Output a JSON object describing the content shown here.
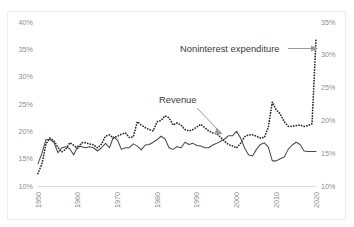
{
  "chart_data": {
    "type": "line",
    "title": "",
    "xlabel": "",
    "ylabel": "",
    "grid": false,
    "legend_position": "inline-annotations",
    "x": [
      1950,
      1951,
      1952,
      1953,
      1954,
      1955,
      1956,
      1957,
      1958,
      1959,
      1960,
      1961,
      1962,
      1963,
      1964,
      1965,
      1966,
      1967,
      1968,
      1969,
      1970,
      1971,
      1972,
      1973,
      1974,
      1975,
      1976,
      1977,
      1978,
      1979,
      1980,
      1981,
      1982,
      1983,
      1984,
      1985,
      1986,
      1987,
      1988,
      1989,
      1990,
      1991,
      1992,
      1993,
      1994,
      1995,
      1996,
      1997,
      1998,
      1999,
      2000,
      2001,
      2002,
      2003,
      2004,
      2005,
      2006,
      2007,
      2008,
      2009,
      2010,
      2011,
      2012,
      2013,
      2014,
      2015,
      2016,
      2017,
      2018,
      2019,
      2020
    ],
    "xtick_labels": [
      "1950",
      "1960",
      "1970",
      "1980",
      "1990",
      "2000",
      "2010",
      "2020"
    ],
    "xticks": [
      1950,
      1960,
      1970,
      1980,
      1990,
      2000,
      2010,
      2020
    ],
    "left_axis": {
      "label": "",
      "ticks": [
        10,
        15,
        20,
        25,
        30,
        35,
        40
      ],
      "tick_labels": [
        "10%",
        "15%",
        "20%",
        "25%",
        "30%",
        "35%",
        "40%"
      ],
      "ylim": [
        10,
        40
      ]
    },
    "right_axis": {
      "label": "",
      "ticks": [
        10,
        15,
        20,
        25,
        30,
        35
      ],
      "tick_labels": [
        "10%",
        "15%",
        "20%",
        "25%",
        "30%",
        "35%"
      ],
      "ylim": [
        10,
        35
      ]
    },
    "series": [
      {
        "name": "Noninterest expenditure",
        "style": "dotted",
        "axis": "right",
        "color": "#2a2a2a",
        "values": [
          11.9,
          13.4,
          16.4,
          17.3,
          16.9,
          15.9,
          15.2,
          15.6,
          16.6,
          16.2,
          15.7,
          16.6,
          16.6,
          16.4,
          16.3,
          15.8,
          16.4,
          17.6,
          17.8,
          17.3,
          17.6,
          17.9,
          18.1,
          17.4,
          17.5,
          19.8,
          19.3,
          18.9,
          18.6,
          18.4,
          19.8,
          20.0,
          20.7,
          20.4,
          19.3,
          19.6,
          19.3,
          18.6,
          18.4,
          18.6,
          19.0,
          19.4,
          18.9,
          18.4,
          18.1,
          18.0,
          17.4,
          16.8,
          16.3,
          16.1,
          15.8,
          16.5,
          17.5,
          17.8,
          17.8,
          17.6,
          17.3,
          17.4,
          19.0,
          22.8,
          21.6,
          21.0,
          19.8,
          19.1,
          19.1,
          19.2,
          19.3,
          19.1,
          19.2,
          19.5,
          32.4
        ]
      },
      {
        "name": "Revenue",
        "style": "solid",
        "axis": "left",
        "color": "#4a4a4a",
        "values": [
          14.1,
          16.0,
          18.5,
          18.5,
          18.0,
          16.1,
          17.0,
          17.2,
          16.8,
          15.7,
          17.3,
          17.2,
          17.0,
          17.2,
          17.0,
          16.4,
          17.0,
          17.8,
          17.0,
          19.0,
          18.4,
          16.7,
          17.0,
          17.0,
          17.7,
          17.3,
          16.6,
          17.5,
          17.6,
          18.0,
          18.5,
          19.1,
          18.6,
          17.0,
          16.7,
          17.2,
          17.0,
          18.0,
          17.6,
          17.8,
          17.4,
          17.3,
          17.0,
          17.0,
          17.5,
          17.8,
          18.2,
          18.6,
          19.2,
          19.2,
          20.0,
          18.8,
          17.0,
          15.7,
          15.5,
          16.7,
          17.6,
          17.9,
          17.1,
          14.6,
          14.6,
          15.0,
          15.3,
          16.7,
          17.5,
          18.0,
          17.6,
          16.4,
          16.3,
          16.3,
          16.3
        ]
      }
    ],
    "annotations": [
      {
        "text": "Noninterest expenditure",
        "pointer": "arrow-right",
        "target_year": 2020
      },
      {
        "text": "Revenue",
        "pointer": "arrow-down-right",
        "target_year": 1998
      }
    ]
  }
}
